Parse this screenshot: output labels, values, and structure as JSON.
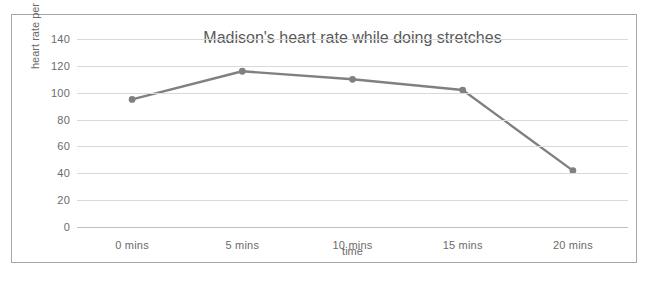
{
  "chart_data": {
    "type": "line",
    "title": "Madison's heart rate while doing stretches",
    "xlabel": "time",
    "ylabel": "heart rate per minute",
    "categories": [
      "0 mins",
      "5 mins",
      "10 mins",
      "15 mins",
      "20 mins"
    ],
    "x": [
      0,
      5,
      10,
      15,
      20
    ],
    "values": [
      95,
      116,
      110,
      102,
      42
    ],
    "series": [
      {
        "name": "heart rate per minute",
        "values": [
          95,
          116,
          110,
          102,
          42
        ]
      }
    ],
    "ylim": [
      0,
      140
    ],
    "yticks": [
      0,
      20,
      40,
      60,
      80,
      100,
      120,
      140
    ],
    "ytick_labels": [
      "0",
      "20",
      "40",
      "60",
      "80",
      "100",
      "120",
      "140"
    ],
    "grid": true,
    "legend": false,
    "legend_position": "none",
    "line_color": "#808080",
    "marker_color": "#808080",
    "marker": "circle",
    "gridline_color": "#d9d9d9",
    "axis_color": "#bfbfbf",
    "text_color": "#6b6b6b",
    "title_color": "#595959",
    "border_color": "#a6a6a6",
    "background_color": "#ffffff"
  }
}
